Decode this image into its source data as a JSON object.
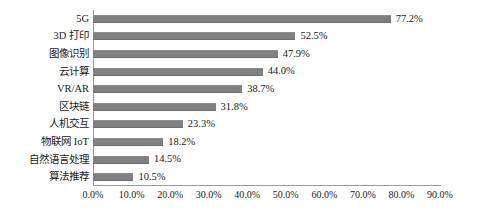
{
  "chart_data": {
    "type": "bar",
    "orientation": "horizontal",
    "title": "",
    "subtitle": "",
    "xlabel": "",
    "ylabel": "",
    "xlim": [
      0,
      90
    ],
    "grid": false,
    "legend": null,
    "bar_color": "#808080",
    "axis_color": "#9a9a9a",
    "text_color": "#1a1a1a",
    "categories": [
      "5G",
      "3D 打印",
      "图像识别",
      "云计算",
      "VR/AR",
      "区块链",
      "人机交互",
      "物联网 IoT",
      "自然语言处理",
      "算法推荐"
    ],
    "values": [
      77.2,
      52.5,
      47.9,
      44.0,
      38.7,
      31.8,
      23.3,
      18.2,
      14.5,
      10.5
    ],
    "value_labels": [
      "77.2%",
      "52.5%",
      "47.9%",
      "44.0%",
      "38.7%",
      "31.8%",
      "23.3%",
      "18.2%",
      "14.5%",
      "10.5%"
    ],
    "xtick_values": [
      0,
      10,
      20,
      30,
      40,
      50,
      60,
      70,
      80,
      90
    ],
    "xtick_labels": [
      "0.0%",
      "10.0%",
      "20.0%",
      "30.0%",
      "40.0%",
      "50.0%",
      "60.0%",
      "70.0%",
      "80.0%",
      "90.0%"
    ]
  }
}
